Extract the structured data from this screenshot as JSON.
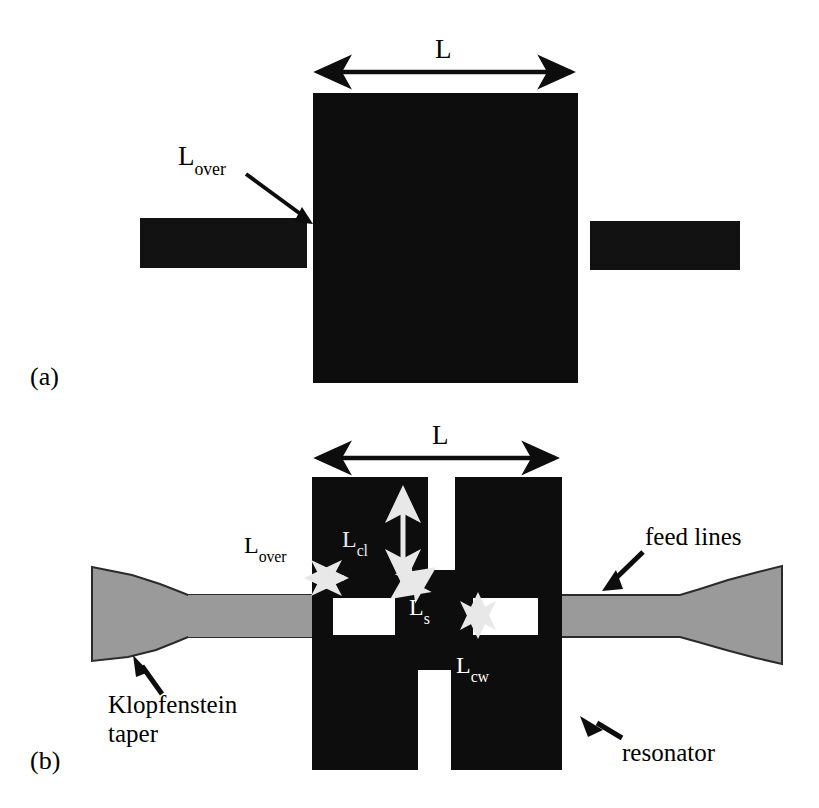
{
  "figure": {
    "type": "technical-diagram",
    "background_color": "#ffffff",
    "metal_color": "#0d0d0d",
    "feed_color": "#9a9a9a",
    "arrow_white_color": "#e8e8e8"
  },
  "panel_a": {
    "tag": "(a)",
    "labels": {
      "length": {
        "base": "L",
        "sub": ""
      },
      "overlap": {
        "base": "L",
        "sub": "over"
      }
    },
    "shapes": {
      "resonator": {
        "x": 313,
        "y": 93,
        "w": 265,
        "h": 290
      },
      "feed_left": {
        "x": 140,
        "y": 218,
        "w": 167,
        "h": 50
      },
      "feed_right": {
        "x": 590,
        "y": 221,
        "w": 150,
        "h": 49
      }
    },
    "dimension_arrow_L": {
      "x1": 313,
      "x2": 578,
      "y": 72
    },
    "pointer_over": {
      "x1": 244,
      "y1": 172,
      "x2": 312,
      "y2": 222
    }
  },
  "panel_b": {
    "tag": "(b)",
    "labels": {
      "length": {
        "base": "L",
        "sub": ""
      },
      "overlap": {
        "base": "L",
        "sub": "over"
      },
      "coupling_length": {
        "base": "L",
        "sub": "cl"
      },
      "spacing": {
        "base": "L",
        "sub": "s"
      },
      "coupling_width": {
        "base": "L",
        "sub": "cw"
      },
      "feed_lines": "feed lines",
      "klopfenstein_taper_line1": "Klopfenstein",
      "klopfenstein_taper_line2": "taper",
      "resonator": "resonator"
    },
    "dimension_arrow_L": {
      "x1": 313,
      "x2": 562,
      "y": 458
    },
    "pointers": {
      "feed_lines": {
        "x1": 641,
        "y1": 552,
        "x2": 603,
        "y2": 589
      },
      "klopfenstein": {
        "x1": 160,
        "y1": 692,
        "x2": 133,
        "y2": 655
      },
      "resonator": {
        "x1": 620,
        "y1": 737,
        "x2": 580,
        "y2": 716
      }
    }
  }
}
